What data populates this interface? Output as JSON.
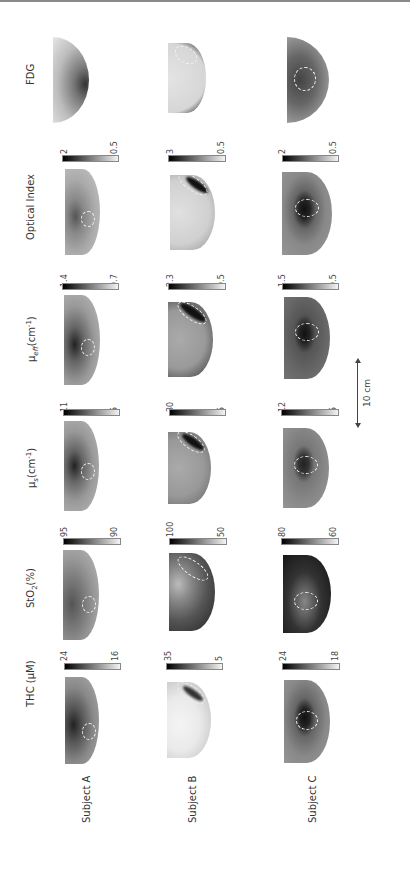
{
  "figure": {
    "orientation": "rotated -90deg",
    "columns": [
      {
        "key": "thc",
        "header": "THC (μM)"
      },
      {
        "key": "sto2",
        "header": "StO₂(%)"
      },
      {
        "key": "mus",
        "header": "μs(cm⁻¹)"
      },
      {
        "key": "mueff",
        "header": "μeff(cm⁻¹)"
      },
      {
        "key": "optical_index",
        "header": "Optical Index"
      },
      {
        "key": "fdg",
        "header": "FDG"
      }
    ],
    "rows": [
      {
        "label": "Subject A"
      },
      {
        "label": "Subject B"
      },
      {
        "label": "Subject C"
      }
    ],
    "colorbars": {
      "thc": [
        {
          "max": "24",
          "min": "16"
        },
        {
          "max": "35",
          "min": "5"
        },
        {
          "max": "24",
          "min": "18"
        }
      ],
      "sto2": [
        {
          "max": "95",
          "min": "90"
        },
        {
          "max": "100",
          "min": "50"
        },
        {
          "max": "80",
          "min": "60"
        }
      ],
      "mus": [
        {
          "max": "11",
          "min": "5"
        },
        {
          "max": "30",
          "min": "5"
        },
        {
          "max": "12",
          "min": "5"
        }
      ],
      "mueff": [
        {
          "max": "1.4",
          "min": "0.7"
        },
        {
          "max": "2.3",
          "min": "0.5"
        },
        {
          "max": "1.5",
          "min": "0.5"
        }
      ],
      "optical_index": [
        {
          "max": "2",
          "min": "0.5"
        },
        {
          "max": "3",
          "min": "0.5"
        },
        {
          "max": "2",
          "min": "0.5"
        }
      ]
    },
    "scale_bar": {
      "label": "10 cm"
    }
  }
}
